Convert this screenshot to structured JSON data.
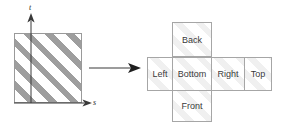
{
  "figure": {
    "source": {
      "name": "hatched-square",
      "axes": {
        "vertical_label": "t",
        "horizontal_label": "s"
      },
      "fill": "diagonal-hatch",
      "hatch_color": "#9e9e9e",
      "border_color": "#9a9a9a"
    },
    "mapping_arrow": {
      "name": "maps-to-arrow",
      "direction": "right"
    },
    "cube_net": {
      "hatch_color": "#f0f0f0",
      "border_color": "#a6a6a6",
      "cells": [
        {
          "id": "back",
          "label": "Back"
        },
        {
          "id": "left",
          "label": "Left"
        },
        {
          "id": "bottom",
          "label": "Bottom"
        },
        {
          "id": "right",
          "label": "Right"
        },
        {
          "id": "top",
          "label": "Top"
        },
        {
          "id": "front",
          "label": "Front"
        }
      ]
    }
  }
}
